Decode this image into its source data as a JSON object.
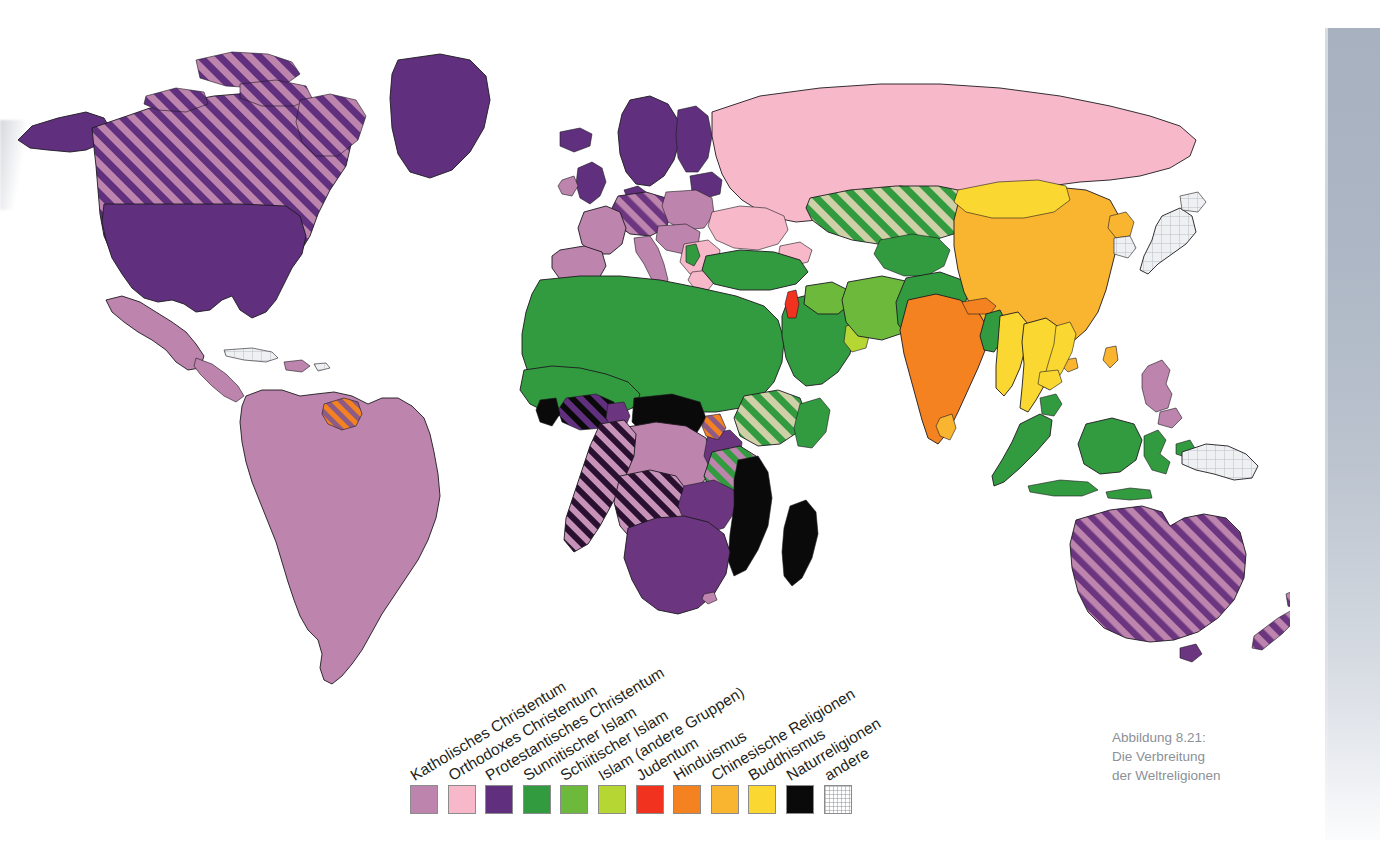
{
  "figure": {
    "caption_lines": [
      "Abbildung 8.21:",
      "Die Verbreitung",
      "der Weltreligionen"
    ],
    "caption_color": "#8d9097"
  },
  "legend": {
    "items": [
      {
        "label": "Katholisches Christentum",
        "color": "#bd84ad",
        "pattern": "solid"
      },
      {
        "label": "Orthodoxes Christentum",
        "color": "#f7b9c9",
        "pattern": "solid"
      },
      {
        "label": "Protestantisches Christentum",
        "color": "#60307e",
        "pattern": "solid"
      },
      {
        "label": "Sunnitischer Islam",
        "color": "#339b3f",
        "pattern": "solid"
      },
      {
        "label": "Schiitischer Islam",
        "color": "#6cb93b",
        "pattern": "solid"
      },
      {
        "label": "Islam (andere Gruppen)",
        "color": "#b6d733",
        "pattern": "solid"
      },
      {
        "label": "Judentum",
        "color": "#f0321e",
        "pattern": "solid"
      },
      {
        "label": "Hinduismus",
        "color": "#f58220",
        "pattern": "solid"
      },
      {
        "label": "Chinesische Religionen",
        "color": "#f9b530",
        "pattern": "solid"
      },
      {
        "label": "Buddhismus",
        "color": "#fbd831",
        "pattern": "solid"
      },
      {
        "label": "Naturreligionen",
        "color": "#0a0a0a",
        "pattern": "solid"
      },
      {
        "label": "andere",
        "color": "#ebedf0",
        "pattern": "grid"
      }
    ]
  },
  "chart_data": {
    "type": "map",
    "title": "Die Verbreitung der Weltreligionen",
    "projection": "world-political",
    "categories": [
      "Katholisches Christentum",
      "Orthodoxes Christentum",
      "Protestantisches Christentum",
      "Sunnitischer Islam",
      "Schiitischer Islam",
      "Islam (andere Gruppen)",
      "Judentum",
      "Hinduismus",
      "Chinesische Religionen",
      "Buddhismus",
      "Naturreligionen",
      "andere"
    ],
    "regions": [
      {
        "name": "Kanada",
        "religion": "Protestantisches Christentum",
        "secondary": "Katholisches Christentum",
        "pattern": "hatched"
      },
      {
        "name": "Vereinigte Staaten",
        "religion": "Protestantisches Christentum",
        "pattern": "solid"
      },
      {
        "name": "Gronland",
        "religion": "Protestantisches Christentum",
        "pattern": "solid"
      },
      {
        "name": "Mexiko",
        "religion": "Katholisches Christentum",
        "pattern": "solid"
      },
      {
        "name": "Mittelamerika",
        "religion": "Katholisches Christentum",
        "pattern": "solid"
      },
      {
        "name": "Kuba",
        "religion": "andere",
        "pattern": "solid"
      },
      {
        "name": "Sudamerika",
        "religion": "Katholisches Christentum",
        "pattern": "solid"
      },
      {
        "name": "Guyana",
        "religion": "Hinduismus",
        "secondary": "Katholisches Christentum",
        "pattern": "hatched"
      },
      {
        "name": "Russland",
        "religion": "Orthodoxes Christentum",
        "pattern": "solid"
      },
      {
        "name": "Ukraine",
        "religion": "Orthodoxes Christentum",
        "pattern": "solid"
      },
      {
        "name": "Griechenland",
        "religion": "Orthodoxes Christentum",
        "pattern": "solid"
      },
      {
        "name": "Rumanien",
        "religion": "Orthodoxes Christentum",
        "pattern": "solid"
      },
      {
        "name": "Skandinavien",
        "religion": "Protestantisches Christentum",
        "pattern": "solid"
      },
      {
        "name": "Grossbritannien",
        "religion": "Protestantisches Christentum",
        "pattern": "solid"
      },
      {
        "name": "Deutschland",
        "religion": "Protestantisches Christentum",
        "secondary": "Katholisches Christentum",
        "pattern": "hatched"
      },
      {
        "name": "Frankreich",
        "religion": "Katholisches Christentum",
        "pattern": "solid"
      },
      {
        "name": "Spanien",
        "religion": "Katholisches Christentum",
        "pattern": "solid"
      },
      {
        "name": "Italien",
        "religion": "Katholisches Christentum",
        "pattern": "solid"
      },
      {
        "name": "Polen",
        "religion": "Katholisches Christentum",
        "pattern": "solid"
      },
      {
        "name": "Nordafrika",
        "religion": "Sunnitischer Islam",
        "pattern": "solid"
      },
      {
        "name": "Arabische Halbinsel",
        "religion": "Sunnitischer Islam",
        "pattern": "solid"
      },
      {
        "name": "Tuerkei",
        "religion": "Sunnitischer Islam",
        "pattern": "solid"
      },
      {
        "name": "Iran",
        "religion": "Schiitischer Islam",
        "pattern": "solid"
      },
      {
        "name": "Irak",
        "religion": "Schiitischer Islam",
        "pattern": "solid"
      },
      {
        "name": "Oman",
        "religion": "Islam (andere Gruppen)",
        "pattern": "solid"
      },
      {
        "name": "Israel",
        "religion": "Judentum",
        "pattern": "solid"
      },
      {
        "name": "Kasachstan",
        "religion": "Sunnitischer Islam",
        "secondary": "Orthodoxes Christentum",
        "pattern": "hatched"
      },
      {
        "name": "Indien",
        "religion": "Hinduismus",
        "pattern": "solid"
      },
      {
        "name": "Nepal",
        "religion": "Hinduismus",
        "pattern": "solid"
      },
      {
        "name": "Bangladesch",
        "religion": "Sunnitischer Islam",
        "pattern": "solid"
      },
      {
        "name": "Pakistan",
        "religion": "Sunnitischer Islam",
        "pattern": "solid"
      },
      {
        "name": "Afghanistan",
        "religion": "Sunnitischer Islam",
        "pattern": "solid"
      },
      {
        "name": "China",
        "religion": "Chinesische Religionen",
        "pattern": "solid"
      },
      {
        "name": "Mongolei",
        "religion": "Buddhismus",
        "pattern": "solid"
      },
      {
        "name": "Myanmar",
        "religion": "Buddhismus",
        "pattern": "solid"
      },
      {
        "name": "Thailand",
        "religion": "Buddhismus",
        "pattern": "solid"
      },
      {
        "name": "Laos",
        "religion": "Buddhismus",
        "pattern": "solid"
      },
      {
        "name": "Kambodscha",
        "religion": "Buddhismus",
        "pattern": "solid"
      },
      {
        "name": "Vietnam",
        "religion": "Buddhismus",
        "pattern": "solid"
      },
      {
        "name": "Sri Lanka",
        "religion": "Chinesische Religionen",
        "pattern": "solid"
      },
      {
        "name": "Japan",
        "religion": "andere",
        "pattern": "solid"
      },
      {
        "name": "Suedkorea",
        "religion": "andere",
        "pattern": "solid"
      },
      {
        "name": "Nordkorea",
        "religion": "Chinesische Religionen",
        "pattern": "solid"
      },
      {
        "name": "Indonesien",
        "religion": "Sunnitischer Islam",
        "pattern": "solid"
      },
      {
        "name": "Malaysia",
        "religion": "Sunnitischer Islam",
        "pattern": "solid"
      },
      {
        "name": "Philippinen",
        "religion": "Katholisches Christentum",
        "pattern": "solid"
      },
      {
        "name": "Papua-Neuguinea",
        "religion": "andere",
        "pattern": "solid"
      },
      {
        "name": "Australien",
        "religion": "Protestantisches Christentum",
        "secondary": "Katholisches Christentum",
        "pattern": "hatched"
      },
      {
        "name": "Neuseeland",
        "religion": "Protestantisches Christentum",
        "secondary": "Katholisches Christentum",
        "pattern": "hatched"
      },
      {
        "name": "Sahelzone",
        "religion": "Sunnitischer Islam",
        "pattern": "solid"
      },
      {
        "name": "Nigeria",
        "religion": "Sunnitischer Islam",
        "secondary": "Protestantisches Christentum",
        "pattern": "hatched"
      },
      {
        "name": "Aethiopien",
        "religion": "Sunnitischer Islam",
        "secondary": "Orthodoxes Christentum",
        "pattern": "hatched"
      },
      {
        "name": "Kenia",
        "religion": "Protestantisches Christentum",
        "pattern": "solid"
      },
      {
        "name": "Tansania",
        "religion": "Sunnitischer Islam",
        "secondary": "Katholisches Christentum",
        "pattern": "hatched"
      },
      {
        "name": "Kongo",
        "religion": "Katholisches Christentum",
        "pattern": "solid"
      },
      {
        "name": "Angola",
        "religion": "Katholisches Christentum",
        "secondary": "Naturreligionen",
        "pattern": "hatched"
      },
      {
        "name": "Sudafrika",
        "religion": "Protestantisches Christentum",
        "pattern": "solid"
      },
      {
        "name": "Mosambik",
        "religion": "Naturreligionen",
        "pattern": "solid"
      },
      {
        "name": "Madagaskar",
        "religion": "Naturreligionen",
        "pattern": "solid"
      },
      {
        "name": "Zentralafrika",
        "religion": "Naturreligionen",
        "pattern": "solid"
      }
    ]
  }
}
